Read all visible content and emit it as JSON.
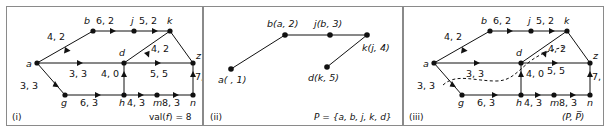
{
  "figure": {
    "caption_style": "three-panel network flow figure",
    "panels": [
      {
        "id": "i",
        "corner_label": "(i)",
        "corner_right": "val(f) = 8",
        "corner_right_prefix": "val(",
        "corner_right_italic": "f",
        "corner_right_suffix": ") = 8",
        "nodes": [
          {
            "name": "a",
            "x": 30,
            "y": 56
          },
          {
            "name": "b",
            "x": 86,
            "y": 24
          },
          {
            "name": "j",
            "x": 127,
            "y": 24
          },
          {
            "name": "k",
            "x": 163,
            "y": 24
          },
          {
            "name": "d",
            "x": 117,
            "y": 56
          },
          {
            "name": "z",
            "x": 186,
            "y": 56
          },
          {
            "name": "g",
            "x": 58,
            "y": 88
          },
          {
            "name": "h",
            "x": 117,
            "y": 88
          },
          {
            "name": "m",
            "x": 150,
            "y": 88
          },
          {
            "name": "n",
            "x": 186,
            "y": 88
          }
        ],
        "edges": [
          {
            "from": "a",
            "to": "b",
            "label": "4, 2"
          },
          {
            "from": "b",
            "to": "j",
            "label": "6, 2"
          },
          {
            "from": "j",
            "to": "k",
            "label": "5, 2"
          },
          {
            "from": "a",
            "to": "d",
            "label": "3, 3"
          },
          {
            "from": "d",
            "to": "k",
            "label": "4, 2"
          },
          {
            "from": "d",
            "to": "z",
            "label": "5, 5"
          },
          {
            "from": "k",
            "to": "z",
            "label": ""
          },
          {
            "from": "a",
            "to": "g",
            "label": "3, 3"
          },
          {
            "from": "g",
            "to": "h",
            "label": "6, 3"
          },
          {
            "from": "h",
            "to": "d",
            "label": "4, 0"
          },
          {
            "from": "h",
            "to": "m",
            "label": "4, 3"
          },
          {
            "from": "m",
            "to": "n",
            "label": "8, 3"
          },
          {
            "from": "n",
            "to": "z",
            "label": "7, 3"
          }
        ]
      },
      {
        "id": "ii",
        "corner_label": "(ii)",
        "corner_right": "P = {a, b, j, k, d}",
        "nodes": [
          {
            "name": "a",
            "label": "a( , 1)",
            "x": 27,
            "y": 62
          },
          {
            "name": "b",
            "label": "b(a, 2)",
            "x": 81,
            "y": 28
          },
          {
            "name": "j",
            "label": "j(b, 3)",
            "x": 126,
            "y": 28
          },
          {
            "name": "k",
            "label": "k(j, 4)",
            "x": 163,
            "y": 28
          },
          {
            "name": "d",
            "label": "d(k, 5)",
            "x": 123,
            "y": 60
          }
        ],
        "edges": [
          {
            "from": "a",
            "to": "b"
          },
          {
            "from": "b",
            "to": "j"
          },
          {
            "from": "j",
            "to": "k"
          },
          {
            "from": "k",
            "to": "d"
          }
        ],
        "labels": {
          "a": "a( , 1)",
          "b": "b(a, 2)",
          "j": "j(b, 3)",
          "k": "k(j, 4)",
          "d": "d(k, 5)"
        }
      },
      {
        "id": "iii",
        "corner_label": "(iii)",
        "corner_right": "(P, P̅)",
        "nodes": [
          {
            "name": "a",
            "x": 30,
            "y": 56
          },
          {
            "name": "b",
            "x": 86,
            "y": 24
          },
          {
            "name": "j",
            "x": 127,
            "y": 24
          },
          {
            "name": "k",
            "x": 163,
            "y": 24
          },
          {
            "name": "d",
            "x": 117,
            "y": 56
          },
          {
            "name": "z",
            "x": 186,
            "y": 56
          },
          {
            "name": "g",
            "x": 58,
            "y": 88
          },
          {
            "name": "h",
            "x": 117,
            "y": 88
          },
          {
            "name": "m",
            "x": 150,
            "y": 88
          },
          {
            "name": "n",
            "x": 186,
            "y": 88
          }
        ],
        "edges": [
          {
            "from": "a",
            "to": "b",
            "label": "4, 2"
          },
          {
            "from": "b",
            "to": "j",
            "label": "6, 2"
          },
          {
            "from": "j",
            "to": "k",
            "label": "5, 2"
          },
          {
            "from": "a",
            "to": "d",
            "label": "3, 3"
          },
          {
            "from": "d",
            "to": "k",
            "label": "4, 2"
          },
          {
            "from": "d",
            "to": "z",
            "label": "5, 5"
          },
          {
            "from": "k",
            "to": "z",
            "label": ""
          },
          {
            "from": "a",
            "to": "g",
            "label": "3, 3"
          },
          {
            "from": "g",
            "to": "h",
            "label": "6, 3"
          },
          {
            "from": "h",
            "to": "d",
            "label": "4, 0"
          },
          {
            "from": "h",
            "to": "m",
            "label": "4, 3"
          },
          {
            "from": "m",
            "to": "n",
            "label": "8, 3"
          },
          {
            "from": "n",
            "to": "z",
            "label": "7, 3"
          }
        ],
        "cut_curve": "dashed cut separating P from P-bar"
      }
    ]
  },
  "colors": {
    "ink": "#111111",
    "border": "#8a8a8a",
    "background": "#ffffff"
  }
}
